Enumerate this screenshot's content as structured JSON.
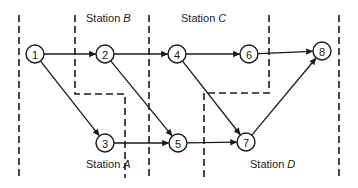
{
  "diagram": {
    "type": "precedence-network-line-balancing",
    "stations": [
      {
        "id": "A",
        "prefix": "Station ",
        "letter": "A",
        "x": 86,
        "y": 168
      },
      {
        "id": "B",
        "prefix": "Station ",
        "letter": "B",
        "x": 86,
        "y": 22
      },
      {
        "id": "C",
        "prefix": "Station ",
        "letter": "C",
        "x": 181,
        "y": 22
      },
      {
        "id": "D",
        "prefix": "Station ",
        "letter": "D",
        "x": 250,
        "y": 168
      }
    ],
    "nodes": [
      {
        "id": "1",
        "label": "1",
        "x": 35,
        "y": 54
      },
      {
        "id": "2",
        "label": "2",
        "x": 105,
        "y": 54
      },
      {
        "id": "3",
        "label": "3",
        "x": 105,
        "y": 143
      },
      {
        "id": "4",
        "label": "4",
        "x": 177,
        "y": 54
      },
      {
        "id": "5",
        "label": "5",
        "x": 178,
        "y": 143
      },
      {
        "id": "6",
        "label": "6",
        "x": 249,
        "y": 54
      },
      {
        "id": "7",
        "label": "7",
        "x": 246,
        "y": 142
      },
      {
        "id": "8",
        "label": "8",
        "x": 322,
        "y": 51
      }
    ],
    "edges": [
      {
        "from": "1",
        "to": "2"
      },
      {
        "from": "1",
        "to": "3"
      },
      {
        "from": "2",
        "to": "4"
      },
      {
        "from": "2",
        "to": "5"
      },
      {
        "from": "3",
        "to": "5"
      },
      {
        "from": "4",
        "to": "6"
      },
      {
        "from": "4",
        "to": "7"
      },
      {
        "from": "5",
        "to": "7"
      },
      {
        "from": "6",
        "to": "8"
      },
      {
        "from": "7",
        "to": "8"
      }
    ],
    "boundaries": [
      {
        "name": "left-boundary",
        "points": "19,15 19,178"
      },
      {
        "name": "boundary-a-b",
        "points": "75,15 75,94 125,94 125,178"
      },
      {
        "name": "boundary-b-c",
        "points": "149,15 149,178"
      },
      {
        "name": "boundary-c-d",
        "points": "269,15 269,93 204,93 204,178"
      },
      {
        "name": "right-boundary",
        "points": "339,15 339,178"
      }
    ],
    "colors": {
      "ink": "#1a1a1a",
      "background": "#ffffff"
    }
  }
}
